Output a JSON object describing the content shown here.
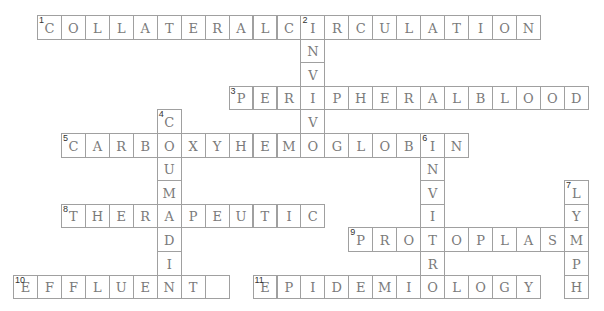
{
  "puzzle": {
    "type": "crossword",
    "words": [
      {
        "number": "1",
        "direction": "across",
        "answer": "COLLATERALCIRCULATION",
        "row": 0,
        "col": 0
      },
      {
        "number": "2",
        "direction": "down",
        "answer": "INVIVO",
        "row": 0,
        "col": 11
      },
      {
        "number": "3",
        "direction": "across",
        "answer": "PERIPHERALBLOOD",
        "row": 3,
        "col": 8
      },
      {
        "number": "4",
        "direction": "down",
        "answer": "COUMADIN",
        "row": 4,
        "col": 5
      },
      {
        "number": "5",
        "direction": "across",
        "answer": "CARBOXYHEMOGLOBIN",
        "row": 5,
        "col": 1
      },
      {
        "number": "6",
        "direction": "down",
        "answer": "INVITRO",
        "row": 5,
        "col": 16
      },
      {
        "number": "7",
        "direction": "down",
        "answer": "LYMPH",
        "row": 7,
        "col": 22
      },
      {
        "number": "8",
        "direction": "across",
        "answer": "THERAPEUTIC",
        "row": 8,
        "col": 1
      },
      {
        "number": "9",
        "direction": "across",
        "answer": "PROTOPLASM",
        "row": 9,
        "col": 13
      },
      {
        "number": "10",
        "direction": "across",
        "answer": "EFFLUENT ",
        "row": 11,
        "col": -1
      },
      {
        "number": "11",
        "direction": "across",
        "answer": "EPIDEMIOLOGY",
        "row": 11,
        "col": 9
      }
    ]
  }
}
